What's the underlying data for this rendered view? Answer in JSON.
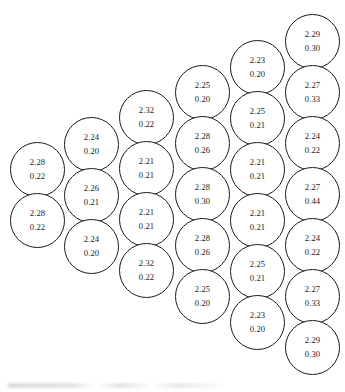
{
  "diagram": {
    "type": "circle-packing-grid",
    "title": "",
    "circle_diameter_px": 55,
    "column_x_step_px": 55,
    "row_y_step_px": 51,
    "column_y_offset_px": -25.5,
    "stroke_color": "#1a1a1a",
    "fill_color": "#ffffff",
    "text_color": "#1c1c1c",
    "columns": [
      {
        "index": 1,
        "x": 10,
        "y_start": 142,
        "circles": [
          {
            "top": "2.28",
            "bottom": "0.22"
          },
          {
            "top": "2.28",
            "bottom": "0.22"
          }
        ]
      },
      {
        "index": 2,
        "x": 64,
        "y_start": 117,
        "circles": [
          {
            "top": "2.24",
            "bottom": "0.20"
          },
          {
            "top": "2.26",
            "bottom": "0.21"
          },
          {
            "top": "2.24",
            "bottom": "0.20"
          }
        ]
      },
      {
        "index": 3,
        "x": 119,
        "y_start": 90,
        "circles": [
          {
            "top": "2.32",
            "bottom": "0.22"
          },
          {
            "top": "2.21",
            "bottom": "0.21"
          },
          {
            "top": "2.21",
            "bottom": "0.21"
          },
          {
            "top": "2.32",
            "bottom": "0.22"
          }
        ]
      },
      {
        "index": 4,
        "x": 175,
        "y_start": 65,
        "circles": [
          {
            "top": "2.25",
            "bottom": "0.20"
          },
          {
            "top": "2.28",
            "bottom": "0.26"
          },
          {
            "top": "2.28",
            "bottom": "0.30"
          },
          {
            "top": "2.28",
            "bottom": "0.26"
          },
          {
            "top": "2.25",
            "bottom": "0.20"
          }
        ]
      },
      {
        "index": 5,
        "x": 230,
        "y_start": 40,
        "circles": [
          {
            "top": "2.23",
            "bottom": "0.20"
          },
          {
            "top": "2.25",
            "bottom": "0.21"
          },
          {
            "top": "2.21",
            "bottom": "0.21"
          },
          {
            "top": "2.21",
            "bottom": "0.21"
          },
          {
            "top": "2.25",
            "bottom": "0.21"
          },
          {
            "top": "2.23",
            "bottom": "0.20"
          }
        ]
      },
      {
        "index": 6,
        "x": 285,
        "y_start": 14,
        "circles": [
          {
            "top": "2.29",
            "bottom": "0.30"
          },
          {
            "top": "2.27",
            "bottom": "0.33"
          },
          {
            "top": "2.24",
            "bottom": "0.22"
          },
          {
            "top": "2.27",
            "bottom": "0.44"
          },
          {
            "top": "2.24",
            "bottom": "0.22"
          },
          {
            "top": "2.27",
            "bottom": "0.33"
          },
          {
            "top": "2.29",
            "bottom": "0.30"
          }
        ]
      }
    ]
  }
}
